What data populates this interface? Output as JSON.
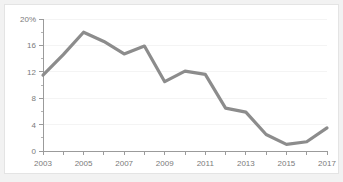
{
  "chart_data": {
    "type": "line",
    "title": "",
    "subtitle": "",
    "xlabel": "",
    "ylabel": "",
    "x": [
      2003,
      2004,
      2005,
      2006,
      2007,
      2008,
      2009,
      2010,
      2011,
      2012,
      2013,
      2014,
      2015,
      2016,
      2017
    ],
    "values": [
      11.5,
      14.6,
      18.0,
      16.6,
      14.7,
      15.9,
      10.5,
      12.1,
      11.6,
      6.5,
      5.9,
      2.5,
      1.0,
      1.4,
      3.5
    ],
    "series": [
      {
        "name": "",
        "color": "#8c8c8c",
        "values": [
          11.5,
          14.6,
          18.0,
          16.6,
          14.7,
          15.9,
          10.5,
          12.1,
          11.6,
          6.5,
          5.9,
          2.5,
          1.0,
          1.4,
          3.5
        ]
      }
    ],
    "xlim": [
      2003,
      2017
    ],
    "ylim": [
      0,
      20
    ],
    "y_ticks": [
      0,
      4,
      8,
      12,
      16,
      20
    ],
    "y_tick_labels": [
      "0",
      "4",
      "8",
      "12",
      "16",
      "20%"
    ],
    "y_minor_ticks": [
      2,
      6,
      10,
      14,
      18
    ],
    "x_ticks": [
      2003,
      2004,
      2005,
      2006,
      2007,
      2008,
      2009,
      2010,
      2011,
      2012,
      2013,
      2014,
      2015,
      2016,
      2017
    ],
    "x_tick_labels": [
      "2003",
      "",
      "2005",
      "",
      "2007",
      "",
      "2009",
      "",
      "2011",
      "",
      "2013",
      "",
      "2015",
      "",
      "2017"
    ],
    "x_labeled": [
      "2003",
      "2005",
      "2007",
      "2009",
      "2011",
      "2013",
      "2015",
      "2017"
    ],
    "grid": true,
    "legend": "none",
    "annotations": []
  },
  "colors": {
    "page_background": "#f2f2f2",
    "card_background": "#ffffff",
    "card_border": "#e4e4e4",
    "line": "#8c8c8c",
    "axis": "#9b9b9b",
    "grid": "#f4f4f4",
    "tick_text": "#7a7a7a"
  }
}
